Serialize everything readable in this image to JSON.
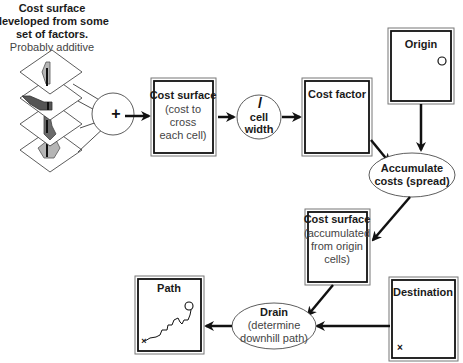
{
  "intro": {
    "lines_bold": [
      "Cost surface",
      "developed from some",
      "set of factors."
    ],
    "line_normal": "Probably additive"
  },
  "operators": {
    "add": "+",
    "divide_symbol": "/",
    "divide_lines": [
      "cell",
      "width"
    ]
  },
  "boxes": {
    "cost_surface": {
      "title": "Cost surface",
      "lines": [
        "(cost to",
        "cross",
        "each cell)"
      ]
    },
    "cost_factor": {
      "title": "Cost factor"
    },
    "origin": {
      "title": "Origin",
      "marker": "o"
    },
    "accumulated": {
      "title": "Cost surface",
      "lines": [
        "(accumulated",
        "from origin",
        "cells)"
      ]
    },
    "destination": {
      "title": "Destination",
      "marker": "×"
    },
    "path": {
      "title": "Path"
    }
  },
  "ellipses": {
    "accumulate": {
      "lines": [
        "Accumulate",
        "costs (spread)"
      ]
    },
    "drain": {
      "title": "Drain",
      "lines": [
        "(determine",
        "downhill path)"
      ]
    }
  },
  "colors": {
    "layer_light": "#b5b5b5",
    "layer_dark": "#6a6a6a",
    "layer_mid": "#8a8a8a"
  }
}
